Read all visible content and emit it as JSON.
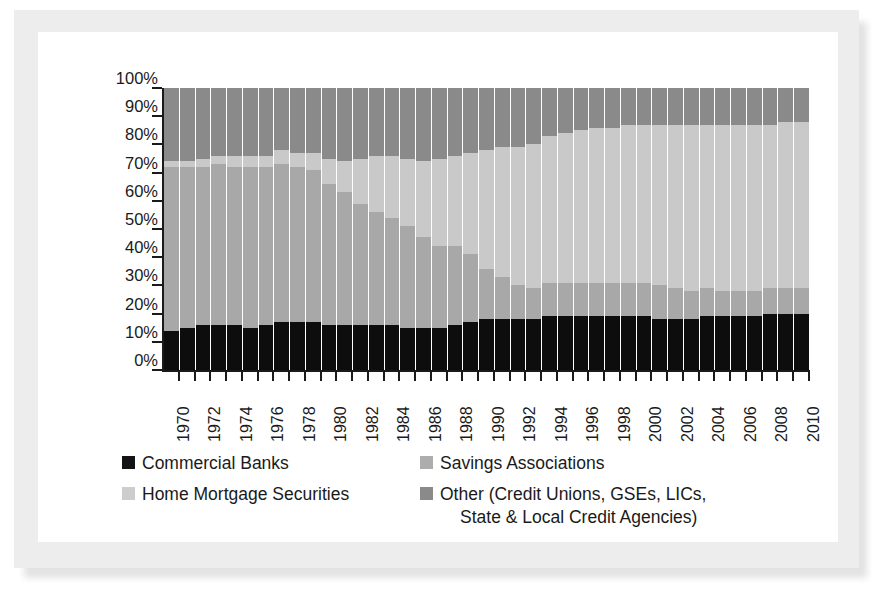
{
  "chart_data": {
    "type": "bar",
    "subtype": "stacked-100-percent",
    "title": "",
    "xlabel": "",
    "ylabel": "Share of Existing Loans",
    "ylim": [
      0,
      100
    ],
    "ytick_labels": [
      "0%",
      "10%",
      "20%",
      "30%",
      "40%",
      "50%",
      "60%",
      "70%",
      "80%",
      "90%",
      "100%"
    ],
    "ytick_values": [
      0,
      10,
      20,
      30,
      40,
      50,
      60,
      70,
      80,
      90,
      100
    ],
    "grid": false,
    "legend_position": "bottom",
    "x": [
      1970,
      1971,
      1972,
      1973,
      1974,
      1975,
      1976,
      1977,
      1978,
      1979,
      1980,
      1981,
      1982,
      1983,
      1984,
      1985,
      1986,
      1987,
      1988,
      1989,
      1990,
      1991,
      1992,
      1993,
      1994,
      1995,
      1996,
      1997,
      1998,
      1999,
      2000,
      2001,
      2002,
      2003,
      2004,
      2005,
      2006,
      2007,
      2008,
      2009,
      2010
    ],
    "x_tick_labels": [
      "1970",
      "1972",
      "1974",
      "1976",
      "1978",
      "1980",
      "1982",
      "1984",
      "1986",
      "1988",
      "1990",
      "1992",
      "1994",
      "1996",
      "1998",
      "2000",
      "2002",
      "2004",
      "2006",
      "2008",
      "2010"
    ],
    "series": [
      {
        "name": "Commercial Banks",
        "color": "#0d0d0d",
        "values": [
          14,
          15,
          16,
          16,
          16,
          15,
          16,
          17,
          17,
          17,
          16,
          16,
          16,
          16,
          16,
          15,
          15,
          15,
          16,
          17,
          18,
          18,
          18,
          18,
          19,
          19,
          19,
          19,
          19,
          19,
          19,
          18,
          18,
          18,
          19,
          19,
          19,
          19,
          20,
          20,
          20
        ]
      },
      {
        "name": "Savings Associations",
        "color": "#a8a8a8",
        "values": [
          58,
          57,
          56,
          57,
          56,
          57,
          56,
          56,
          55,
          54,
          50,
          47,
          43,
          40,
          38,
          36,
          32,
          29,
          28,
          24,
          18,
          15,
          12,
          11,
          12,
          12,
          12,
          12,
          12,
          12,
          12,
          12,
          11,
          10,
          10,
          9,
          9,
          9,
          9,
          9,
          9
        ]
      },
      {
        "name": "Home Mortgage Securities",
        "color": "#c9c9c9",
        "values": [
          2,
          2,
          3,
          3,
          4,
          4,
          4,
          5,
          5,
          6,
          9,
          11,
          16,
          20,
          22,
          24,
          27,
          31,
          32,
          36,
          42,
          46,
          49,
          51,
          52,
          53,
          54,
          55,
          55,
          56,
          56,
          57,
          58,
          59,
          58,
          59,
          59,
          59,
          58,
          59,
          59
        ]
      },
      {
        "name": "Other (Credit Unions, GSEs, LICs, State & Local Credit Agencies)",
        "color": "#8a8a8a",
        "values": [
          26,
          26,
          25,
          24,
          24,
          24,
          24,
          22,
          23,
          23,
          25,
          26,
          25,
          24,
          24,
          25,
          26,
          25,
          24,
          23,
          22,
          21,
          21,
          20,
          17,
          16,
          15,
          14,
          14,
          13,
          13,
          13,
          13,
          13,
          13,
          13,
          13,
          13,
          13,
          12,
          12
        ]
      }
    ]
  },
  "legend": {
    "items": [
      {
        "label": "Commercial Banks",
        "swatch": "banks"
      },
      {
        "label": "Savings Associations",
        "swatch": "savings"
      },
      {
        "label": "Home Mortgage Securities",
        "swatch": "hms"
      },
      {
        "label": "Other (Credit Unions, GSEs, LICs,",
        "label_line2": "State & Local Credit Agencies)",
        "swatch": "other"
      }
    ]
  }
}
